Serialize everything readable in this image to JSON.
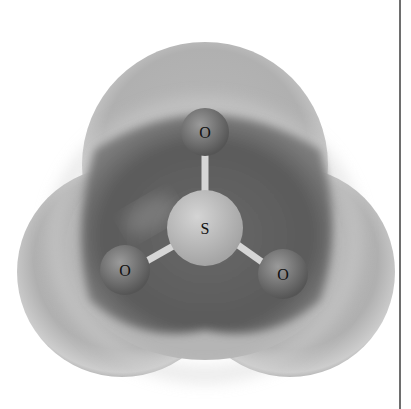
{
  "figure": {
    "molecule": "SO3",
    "atoms": [
      {
        "label": "O",
        "role": "top-oxygen",
        "cx": 205,
        "cy": 132,
        "r": 24
      },
      {
        "label": "S",
        "role": "central-sulfur",
        "cx": 205,
        "cy": 228,
        "r": 38
      },
      {
        "label": "O",
        "role": "left-oxygen",
        "cx": 125,
        "cy": 270,
        "r": 25
      },
      {
        "label": "O",
        "role": "right-oxygen",
        "cx": 283,
        "cy": 274,
        "r": 25
      }
    ],
    "colors": {
      "background": "#ffffff",
      "surface_light": "#cfcfcf",
      "surface_mid": "#9a9a9a",
      "cavity_dark": "#5e5e5e",
      "sulfur": "#bdbdbd",
      "oxygen": "#7a7a7a",
      "divider": "#6e6e6e"
    }
  }
}
